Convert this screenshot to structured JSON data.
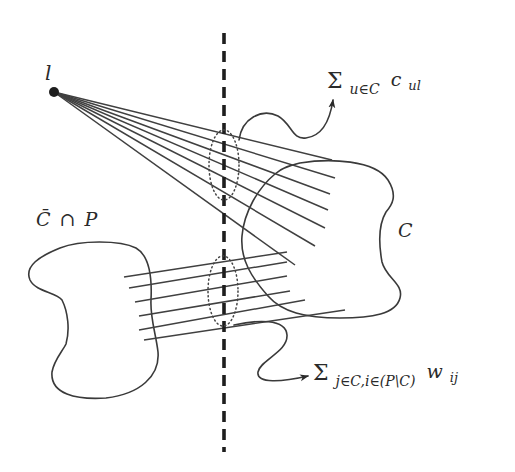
{
  "diagram": {
    "type": "graph-cut illustration",
    "colors": {
      "ink": "#3a3a3a",
      "cut_line": "#1e1e1e",
      "background": "#ffffff"
    },
    "nodes": {
      "point_label": "l",
      "cluster_right_label": "C",
      "cluster_left_label_bar": "C̄",
      "cluster_left_label_cap": "∩",
      "cluster_left_label_P": "P"
    },
    "annotations": {
      "top_sum": {
        "sigma": "Σ",
        "subscript": "u∈C",
        "term": "c",
        "term_subscript": "ul"
      },
      "bottom_sum": {
        "sigma": "Σ",
        "subscript": "j∈C,i∈(P\\C)",
        "term": "w",
        "term_subscript": "ij"
      }
    },
    "edges": {
      "fan_from_l_count": 7,
      "parallel_between_clusters_count": 6
    },
    "elements": {
      "cut_line": "dashed vertical cut",
      "top_ellipse": "dotted ellipse grouping edges from l crossing the cut",
      "bottom_ellipse": "dotted ellipse grouping edges between clusters crossing the cut"
    }
  }
}
